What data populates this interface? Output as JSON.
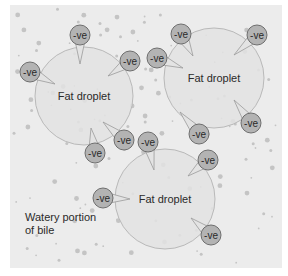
{
  "diagram": {
    "panel": {
      "x": 10,
      "y": 5,
      "width": 272,
      "height": 263,
      "background": "#ececec"
    },
    "colors": {
      "droplet_fill": "#e3e3e3",
      "droplet_stroke": "#b9b9b9",
      "bubble_fill": "#b3b3b3",
      "bubble_stroke": "#6e6e6e",
      "dot": "#c4c4c4",
      "text": "#2a2a2a"
    },
    "droplets": [
      {
        "label": "Fat droplet",
        "cx": 84,
        "cy": 96,
        "r": 49
      },
      {
        "label": "Fat droplet",
        "cx": 214,
        "cy": 78,
        "r": 50
      },
      {
        "label": "Fat droplet",
        "cx": 165,
        "cy": 199,
        "r": 50
      }
    ],
    "charge_label": "-ve",
    "charges": [
      {
        "label": "-ve",
        "cx": 80,
        "cy": 35,
        "tx": 80,
        "ty": 64
      },
      {
        "label": "-ve",
        "cx": 30,
        "cy": 72,
        "tx": 55,
        "ty": 84
      },
      {
        "label": "-ve",
        "cx": 130,
        "cy": 61,
        "tx": 108,
        "ty": 76
      },
      {
        "label": "-ve",
        "cx": 157,
        "cy": 58,
        "tx": 183,
        "ty": 68
      },
      {
        "label": "-ve",
        "cx": 181,
        "cy": 34,
        "tx": 193,
        "ty": 56
      },
      {
        "label": "-ve",
        "cx": 257,
        "cy": 35,
        "tx": 234,
        "ty": 55
      },
      {
        "label": "-ve",
        "cx": 124,
        "cy": 140,
        "tx": 103,
        "ty": 122
      },
      {
        "label": "-ve",
        "cx": 95,
        "cy": 153,
        "tx": 91,
        "ty": 128
      },
      {
        "label": "-ve",
        "cx": 148,
        "cy": 142,
        "tx": 154,
        "ty": 170
      },
      {
        "label": "-ve",
        "cx": 199,
        "cy": 134,
        "tx": 180,
        "ty": 112
      },
      {
        "label": "-ve",
        "cx": 251,
        "cy": 123,
        "tx": 234,
        "ty": 100
      },
      {
        "label": "-ve",
        "cx": 208,
        "cy": 160,
        "tx": 188,
        "ty": 176
      },
      {
        "label": "-ve",
        "cx": 103,
        "cy": 198,
        "tx": 130,
        "ty": 199
      },
      {
        "label": "-ve",
        "cx": 211,
        "cy": 235,
        "tx": 191,
        "ty": 218
      }
    ],
    "annotation": {
      "line1": "Watery portion",
      "line2": "of bile"
    }
  }
}
